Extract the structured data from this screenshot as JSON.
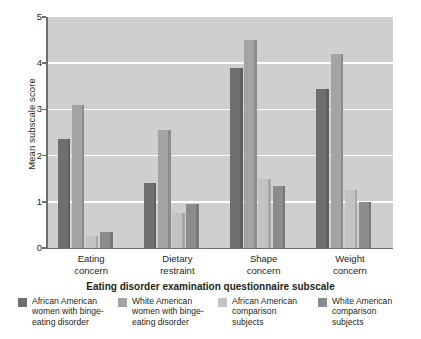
{
  "chart_data": {
    "type": "bar",
    "title": "",
    "xlabel": "Eating disorder examination questionnaire subscale",
    "ylabel": "Mean subscale score",
    "ylim": [
      0,
      5
    ],
    "yticks": [
      "0",
      "1",
      "2",
      "3",
      "4",
      "5"
    ],
    "grid": true,
    "legend_position": "bottom",
    "categories": [
      "Eating concern",
      "Dietary restraint",
      "Shape concern",
      "Weight concern"
    ],
    "category_lines": [
      [
        "Eating",
        "concern"
      ],
      [
        "Dietary",
        "restraint"
      ],
      [
        "Shape",
        "concern"
      ],
      [
        "Weight",
        "concern"
      ]
    ],
    "series": [
      {
        "name": "African American women with binge-eating disorder",
        "name_lines": [
          "African American",
          "women with binge-",
          "eating disorder"
        ],
        "color": "#6e6f71",
        "values": [
          2.35,
          1.4,
          3.9,
          3.45
        ]
      },
      {
        "name": "White American women with binge-eating disorder",
        "name_lines": [
          "White American",
          "women with binge-",
          "eating disorder"
        ],
        "color": "#a2a3a5",
        "values": [
          3.1,
          2.55,
          4.5,
          4.2
        ]
      },
      {
        "name": "African American comparison subjects",
        "name_lines": [
          "African American",
          "comparison",
          "subjects"
        ],
        "color": "#c2c3c5",
        "values": [
          0.25,
          0.75,
          1.5,
          1.25
        ]
      },
      {
        "name": "White American comparison subjects",
        "name_lines": [
          "White American",
          "comparison",
          "subjects"
        ],
        "color": "#8b8c8e",
        "values": [
          0.35,
          0.95,
          1.35,
          1.0
        ]
      }
    ]
  },
  "axis": {
    "y_title": "Mean subscale score",
    "x_title": "Eating disorder examination questionnaire subscale"
  }
}
